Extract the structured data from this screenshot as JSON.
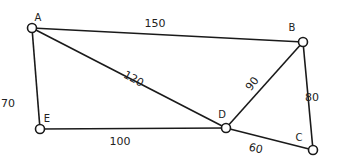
{
  "diagram": {
    "type": "weighted-undirected-graph",
    "nodes": [
      {
        "id": "A",
        "label": "A",
        "x": 32,
        "y": 28,
        "lx": 38,
        "ly": 21
      },
      {
        "id": "B",
        "label": "B",
        "x": 303,
        "y": 42,
        "lx": 292,
        "ly": 31
      },
      {
        "id": "C",
        "label": "C",
        "x": 313,
        "y": 150,
        "lx": 299,
        "ly": 141
      },
      {
        "id": "D",
        "label": "D",
        "x": 226,
        "y": 128,
        "lx": 222,
        "ly": 118
      },
      {
        "id": "E",
        "label": "E",
        "x": 40,
        "y": 129,
        "lx": 47,
        "ly": 122
      }
    ],
    "edges": [
      {
        "from": "A",
        "to": "B",
        "weight": "150",
        "lx": 155,
        "ly": 27,
        "rot": 0
      },
      {
        "from": "A",
        "to": "E",
        "weight": "70",
        "lx": 8,
        "ly": 107,
        "rot": 0
      },
      {
        "from": "A",
        "to": "D",
        "weight": "120",
        "lx": 132,
        "ly": 82,
        "rot": 28
      },
      {
        "from": "B",
        "to": "D",
        "weight": "90",
        "lx": 255,
        "ly": 86,
        "rot": -52
      },
      {
        "from": "B",
        "to": "C",
        "weight": "80",
        "lx": 312,
        "ly": 101,
        "rot": 0
      },
      {
        "from": "E",
        "to": "D",
        "weight": "100",
        "lx": 120,
        "ly": 145,
        "rot": 0
      },
      {
        "from": "D",
        "to": "C",
        "weight": "60",
        "lx": 255,
        "ly": 152,
        "rot": 12
      }
    ]
  }
}
